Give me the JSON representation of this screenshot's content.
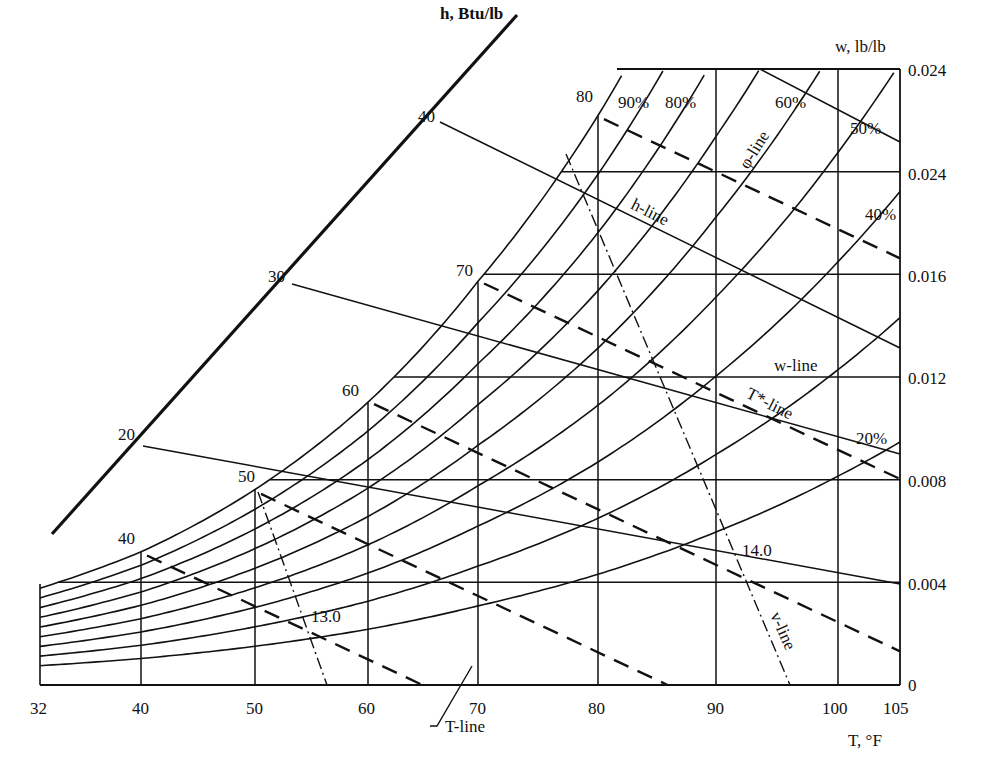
{
  "chart_data": {
    "type": "line",
    "xlabel": "T, °F",
    "ylabel_right": "w, lb/lb",
    "enthalpy_scale_label": "h, Btu/lb",
    "x_ticks": [
      "32",
      "40",
      "50",
      "60",
      "70",
      "80",
      "90",
      "100",
      "105"
    ],
    "x_tick_values": [
      32,
      40,
      50,
      60,
      70,
      80,
      90,
      100,
      105
    ],
    "y_ticks_right": [
      "0",
      "0.004",
      "0.008",
      "0.012",
      "0.016",
      "0.024",
      "0.024"
    ],
    "y_tick_values": [
      0,
      0.004,
      0.008,
      0.012,
      0.016,
      0.02,
      0.024
    ],
    "xlim": [
      32,
      105
    ],
    "ylim": [
      0,
      0.024
    ],
    "enthalpy_ticks": [
      "20",
      "30",
      "40"
    ],
    "enthalpy_tick_values": [
      20,
      30,
      40
    ],
    "saturation_temperature_labels": [
      "40",
      "50",
      "60",
      "70",
      "80"
    ],
    "relative_humidity_curves": [
      {
        "name": "100% (saturation)",
        "label": ""
      },
      {
        "name": "90%",
        "label": "90%"
      },
      {
        "name": "80%",
        "label": "80%"
      },
      {
        "name": "60%",
        "label": "60%"
      },
      {
        "name": "50%",
        "label": "50%"
      },
      {
        "name": "40%",
        "label": "40%"
      },
      {
        "name": "20%",
        "label": "20%"
      }
    ],
    "specific_volume_labels": [
      "13.0",
      "14.0"
    ],
    "annotations": {
      "phi_line": "φ-line",
      "h_line": "h-line",
      "w_line": "w-line",
      "t_star_line": "T*-line",
      "v_line": "v-line",
      "t_line": "T-line"
    },
    "legend_position": "none",
    "grid": true
  }
}
